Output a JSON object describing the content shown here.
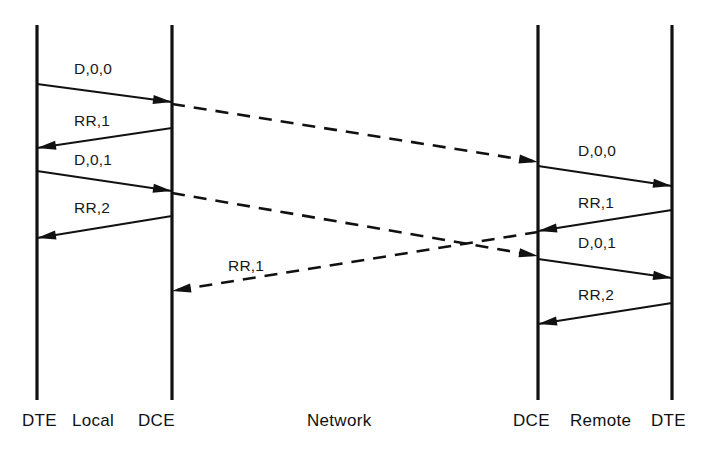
{
  "diagram": {
    "type": "sequence-diagram",
    "background_color": "#ffffff",
    "line_color": "#111111",
    "lifelines": [
      {
        "id": "dte-local",
        "label": "DTE",
        "x": 37
      },
      {
        "id": "dce-local",
        "label": "DCE",
        "x": 172
      },
      {
        "id": "dce-remote",
        "label": "DCE",
        "x": 538
      },
      {
        "id": "dte-remote",
        "label": "DTE",
        "x": 672
      }
    ],
    "axis_labels": [
      {
        "id": "label-dte-left",
        "text": "DTE",
        "x": 22,
        "y": 412
      },
      {
        "id": "label-local",
        "text": "Local",
        "x": 72,
        "y": 412
      },
      {
        "id": "label-dce-left",
        "text": "DCE",
        "x": 138,
        "y": 412
      },
      {
        "id": "label-network",
        "text": "Network",
        "x": 307,
        "y": 412
      },
      {
        "id": "label-dce-right",
        "text": "DCE",
        "x": 513,
        "y": 412
      },
      {
        "id": "label-remote",
        "text": "Remote",
        "x": 570,
        "y": 412
      },
      {
        "id": "label-dte-right",
        "text": "DTE",
        "x": 651,
        "y": 412
      }
    ],
    "messages": [
      {
        "id": "m1",
        "text": "D,0,0",
        "style": "solid",
        "from": "dte-local",
        "to": "dce-local",
        "x1": 37,
        "y1": 84,
        "x2": 172,
        "y2": 102,
        "label_x": 74,
        "label_y": 61
      },
      {
        "id": "m2",
        "text": "RR,1",
        "style": "solid",
        "from": "dce-local",
        "to": "dte-local",
        "x1": 172,
        "y1": 128,
        "x2": 37,
        "y2": 148,
        "label_x": 74,
        "label_y": 113
      },
      {
        "id": "m3",
        "text": "D,0,1",
        "style": "solid",
        "from": "dte-local",
        "to": "dce-local",
        "x1": 37,
        "y1": 171,
        "x2": 172,
        "y2": 191,
        "label_x": 74,
        "label_y": 152
      },
      {
        "id": "m4",
        "text": "RR,2",
        "style": "solid",
        "from": "dce-local",
        "to": "dte-local",
        "x1": 172,
        "y1": 216,
        "x2": 37,
        "y2": 238,
        "label_x": 74,
        "label_y": 200
      },
      {
        "id": "m5",
        "text": "",
        "style": "dashed",
        "from": "dce-local",
        "to": "dce-remote",
        "x1": 172,
        "y1": 104,
        "x2": 538,
        "y2": 162
      },
      {
        "id": "m6",
        "text": "",
        "style": "dashed",
        "from": "dce-local",
        "to": "dce-remote",
        "x1": 172,
        "y1": 193,
        "x2": 538,
        "y2": 256
      },
      {
        "id": "m7",
        "text": "RR,1",
        "style": "dashed",
        "from": "dce-remote",
        "to": "dce-local",
        "x1": 538,
        "y1": 232,
        "x2": 172,
        "y2": 291,
        "label_x": 228,
        "label_y": 258
      },
      {
        "id": "m8",
        "text": "D,0,0",
        "style": "solid",
        "from": "dce-remote",
        "to": "dte-remote",
        "x1": 538,
        "y1": 166,
        "x2": 672,
        "y2": 186,
        "label_x": 578,
        "label_y": 143
      },
      {
        "id": "m9",
        "text": "RR,1",
        "style": "solid",
        "from": "dte-remote",
        "to": "dce-remote",
        "x1": 672,
        "y1": 210,
        "x2": 538,
        "y2": 231,
        "label_x": 578,
        "label_y": 195
      },
      {
        "id": "m10",
        "text": "D,0,1",
        "style": "solid",
        "from": "dce-remote",
        "to": "dte-remote",
        "x1": 538,
        "y1": 259,
        "x2": 672,
        "y2": 278,
        "label_x": 578,
        "label_y": 235
      },
      {
        "id": "m11",
        "text": "RR,2",
        "style": "solid",
        "from": "dte-remote",
        "to": "dce-remote",
        "x1": 672,
        "y1": 303,
        "x2": 538,
        "y2": 324,
        "label_x": 578,
        "label_y": 287
      }
    ],
    "lifeline_top": 25,
    "lifeline_bottom": 400
  }
}
